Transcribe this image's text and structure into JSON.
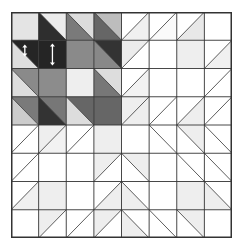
{
  "grid": {
    "rows": 8,
    "cols": 8,
    "line_color": "#333333",
    "cells": [
      [
        {
          "diag": "none",
          "a": "#e4e4e4",
          "b": "#e4e4e4"
        },
        {
          "diag": "back",
          "a": "#ececec",
          "b": "#2e2e2e"
        },
        {
          "diag": "back",
          "a": "#dcdcdc",
          "b": "#7a7a7a"
        },
        {
          "diag": "back",
          "a": "#bdbdbd",
          "b": "#666666"
        },
        {
          "diag": "fwd",
          "a": "#ffffff",
          "b": "#f0f0f0"
        },
        {
          "diag": "fwd",
          "a": "#ffffff",
          "b": "#fafafa"
        },
        {
          "diag": "fwd",
          "a": "#ffffff",
          "b": "#e8e8e8"
        },
        {
          "diag": "none",
          "a": "#ffffff",
          "b": "#ffffff"
        }
      ],
      [
        {
          "diag": "back",
          "a": "#252525",
          "b": "#dedede",
          "arrow": "short"
        },
        {
          "diag": "none",
          "a": "#252525",
          "b": "#252525",
          "arrow": "long"
        },
        {
          "diag": "none",
          "a": "#8a8a8a",
          "b": "#8a8a8a"
        },
        {
          "diag": "back",
          "a": "#333333",
          "b": "#888888"
        },
        {
          "diag": "fwd",
          "a": "#ececec",
          "b": "#ffffff"
        },
        {
          "diag": "none",
          "a": "#ffffff",
          "b": "#ffffff"
        },
        {
          "diag": "none",
          "a": "#eeeeee",
          "b": "#eeeeee"
        },
        {
          "diag": "fwd",
          "a": "#ffffff",
          "b": "#f0f0f0"
        }
      ],
      [
        {
          "diag": "back",
          "a": "#8a8a8a",
          "b": "#dddddd"
        },
        {
          "diag": "none",
          "a": "#8c8c8c",
          "b": "#8c8c8c"
        },
        {
          "diag": "none",
          "a": "#eeeeee",
          "b": "#eeeeee"
        },
        {
          "diag": "back",
          "a": "#dddddd",
          "b": "#777777"
        },
        {
          "diag": "fwd",
          "a": "#ffffff",
          "b": "#f2f2f2"
        },
        {
          "diag": "none",
          "a": "#ffffff",
          "b": "#ffffff"
        },
        {
          "diag": "none",
          "a": "#ffffff",
          "b": "#ffffff"
        },
        {
          "diag": "fwd",
          "a": "#ffffff",
          "b": "#ffffff"
        }
      ],
      [
        {
          "diag": "back",
          "a": "#7a7a7a",
          "b": "#cccccc"
        },
        {
          "diag": "back",
          "a": "#777777",
          "b": "#333333"
        },
        {
          "diag": "back",
          "a": "#666666",
          "b": "#dddddd"
        },
        {
          "diag": "none",
          "a": "#666666",
          "b": "#666666"
        },
        {
          "diag": "fwd",
          "a": "#eeeeee",
          "b": "#eeeeee"
        },
        {
          "diag": "fwd",
          "a": "#ffffff",
          "b": "#ffffff"
        },
        {
          "diag": "fwd",
          "a": "#ffffff",
          "b": "#eeeeee"
        },
        {
          "diag": "fwd",
          "a": "#ffffff",
          "b": "#ffffff"
        }
      ],
      [
        {
          "diag": "fwd",
          "a": "#ffffff",
          "b": "#ffffff"
        },
        {
          "diag": "fwd",
          "a": "#eeeeee",
          "b": "#f2f2f2"
        },
        {
          "diag": "fwd",
          "a": "#ffffff",
          "b": "#ffffff"
        },
        {
          "diag": "none",
          "a": "#eeeeee",
          "b": "#eeeeee"
        },
        {
          "diag": "none",
          "a": "#ffffff",
          "b": "#ffffff"
        },
        {
          "diag": "back",
          "a": "#ffffff",
          "b": "#ffffff"
        },
        {
          "diag": "back",
          "a": "#eeeeee",
          "b": "#ffffff"
        },
        {
          "diag": "back",
          "a": "#ffffff",
          "b": "#ffffff"
        }
      ],
      [
        {
          "diag": "fwd",
          "a": "#ffffff",
          "b": "#ffffff"
        },
        {
          "diag": "none",
          "a": "#ffffff",
          "b": "#ffffff"
        },
        {
          "diag": "none",
          "a": "#ffffff",
          "b": "#ffffff"
        },
        {
          "diag": "fwd",
          "a": "#eeeeee",
          "b": "#ffffff"
        },
        {
          "diag": "back",
          "a": "#eeeeee",
          "b": "#ffffff"
        },
        {
          "diag": "none",
          "a": "#ffffff",
          "b": "#ffffff"
        },
        {
          "diag": "back",
          "a": "#ffffff",
          "b": "#ffffff"
        },
        {
          "diag": "back",
          "a": "#ffffff",
          "b": "#ffffff"
        }
      ],
      [
        {
          "diag": "fwd",
          "a": "#ffffff",
          "b": "#f0f0f0"
        },
        {
          "diag": "none",
          "a": "#eeeeee",
          "b": "#eeeeee"
        },
        {
          "diag": "none",
          "a": "#ffffff",
          "b": "#ffffff"
        },
        {
          "diag": "fwd",
          "a": "#ffffff",
          "b": "#eeeeee"
        },
        {
          "diag": "back",
          "a": "#ffffff",
          "b": "#eeeeee"
        },
        {
          "diag": "none",
          "a": "#ffffff",
          "b": "#ffffff"
        },
        {
          "diag": "none",
          "a": "#eeeeee",
          "b": "#eeeeee"
        },
        {
          "diag": "back",
          "a": "#ffffff",
          "b": "#eeeeee"
        }
      ],
      [
        {
          "diag": "none",
          "a": "#ffffff",
          "b": "#ffffff"
        },
        {
          "diag": "fwd",
          "a": "#eeeeee",
          "b": "#ffffff"
        },
        {
          "diag": "fwd",
          "a": "#ffffff",
          "b": "#ffffff"
        },
        {
          "diag": "fwd",
          "a": "#eeeeee",
          "b": "#ffffff"
        },
        {
          "diag": "back",
          "a": "#ffffff",
          "b": "#eeeeee"
        },
        {
          "diag": "back",
          "a": "#ffffff",
          "b": "#ffffff"
        },
        {
          "diag": "back",
          "a": "#eeeeee",
          "b": "#ffffff"
        },
        {
          "diag": "none",
          "a": "#ffffff",
          "b": "#ffffff"
        }
      ]
    ]
  }
}
